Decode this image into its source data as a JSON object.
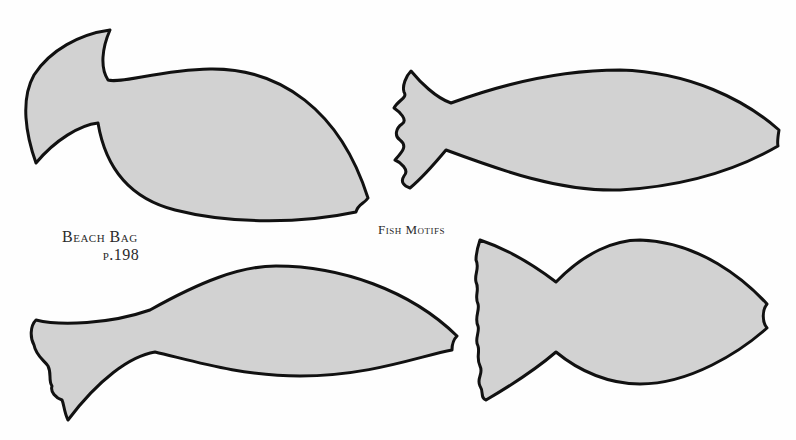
{
  "labels": {
    "project_title": "Beach Bag",
    "project_page": "p.198",
    "motif_title": "Fish Motifs"
  },
  "colors": {
    "fish_fill": "#d2d2d2",
    "outline": "#111111",
    "background": "#fefefe"
  },
  "motifs": [
    {
      "name": "fish-motif-1",
      "description": "fish with upswept crescent tail",
      "position": "top-left"
    },
    {
      "name": "fish-motif-2",
      "description": "slender fish with scalloped tail",
      "position": "top-right"
    },
    {
      "name": "fish-motif-3",
      "description": "long fish with drooping scalloped tail",
      "position": "bottom-left"
    },
    {
      "name": "fish-motif-4",
      "description": "rounded fish with wavy-edged tail",
      "position": "bottom-right"
    }
  ]
}
